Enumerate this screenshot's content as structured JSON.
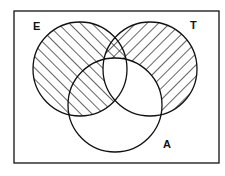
{
  "diagram": {
    "type": "venn",
    "frame": {
      "x": 14,
      "y": 11,
      "width": 205,
      "height": 152
    },
    "colors": {
      "line": "#111111",
      "background": "#ffffff",
      "hatch": "#111111"
    },
    "sets": [
      {
        "id": "E",
        "label": "E",
        "cx": 80,
        "cy": 69,
        "r": 47,
        "label_x": 33,
        "label_y": 30,
        "hatch": "forward-diagonal"
      },
      {
        "id": "T",
        "label": "T",
        "cx": 150,
        "cy": 69,
        "r": 47,
        "label_x": 190,
        "label_y": 29,
        "hatch": "back-diagonal"
      },
      {
        "id": "A",
        "label": "A",
        "cx": 115,
        "cy": 105,
        "r": 47,
        "label_x": 163,
        "label_y": 148,
        "hatch": "none"
      }
    ],
    "shaded_regions": [
      {
        "region": "E only",
        "pattern": "forward-diagonal"
      },
      {
        "region": "E ∩ A (not T)",
        "pattern": "forward-diagonal"
      },
      {
        "region": "T only",
        "pattern": "back-diagonal"
      },
      {
        "region": "E ∩ T (not A)",
        "pattern": "crosshatch"
      }
    ],
    "unshaded_regions": [
      "E ∩ T ∩ A",
      "T ∩ A (not E)",
      "A only",
      "outside"
    ]
  }
}
